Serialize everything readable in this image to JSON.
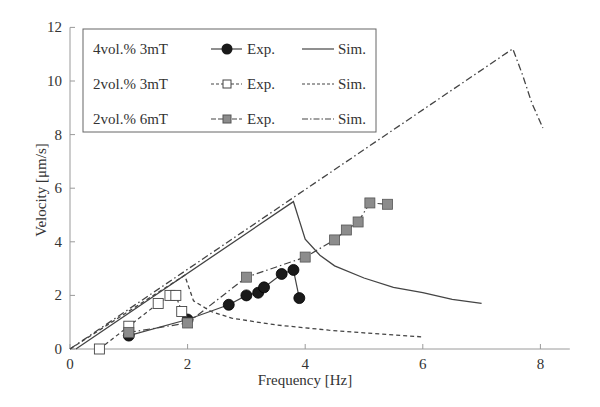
{
  "chart_data": {
    "type": "line",
    "title": "",
    "xlabel": "Frequency [Hz]",
    "ylabel": "Velocity [μm/s]",
    "xlim": [
      0,
      8.5
    ],
    "ylim": [
      0,
      12
    ],
    "x_ticks": [
      "0",
      "2",
      "4",
      "6",
      "8"
    ],
    "y_ticks": [
      "0",
      "2",
      "4",
      "6",
      "8",
      "10",
      "12"
    ],
    "grid": false,
    "legend_position": "upper-left",
    "legend": [
      {
        "group": "4vol.% 3mT",
        "exp_label": "Exp.",
        "sim_label": "Sim."
      },
      {
        "group": "2vol.% 3mT",
        "exp_label": "Exp.",
        "sim_label": "Sim."
      },
      {
        "group": "2vol.% 6mT",
        "exp_label": "Exp.",
        "sim_label": "Sim."
      }
    ],
    "series": [
      {
        "name": "4vol.% 3mT Exp.",
        "style": "solid-line filled-circle",
        "x": [
          1.0,
          2.0,
          2.7,
          3.0,
          3.2,
          3.3,
          3.6,
          3.8,
          3.9
        ],
        "y": [
          0.5,
          1.1,
          1.65,
          2.0,
          2.1,
          2.3,
          2.8,
          2.95,
          1.9
        ]
      },
      {
        "name": "4vol.% 3mT Sim.",
        "style": "solid",
        "x": [
          0.1,
          3.8,
          3.9,
          4.0,
          4.25,
          4.5,
          5.0,
          5.5,
          6.0,
          6.5,
          7.0
        ],
        "y": [
          0.0,
          5.5,
          4.8,
          4.1,
          3.5,
          3.1,
          2.65,
          2.3,
          2.1,
          1.85,
          1.7
        ]
      },
      {
        "name": "2vol.% 3mT Exp.",
        "style": "dashed-line open-square",
        "x": [
          0.5,
          1.0,
          1.5,
          1.7,
          1.8,
          1.9
        ],
        "y": [
          0.0,
          0.85,
          1.7,
          2.0,
          2.0,
          1.4
        ]
      },
      {
        "name": "2vol.% 3mT Sim.",
        "style": "dashed",
        "x": [
          0.0,
          1.95,
          2.1,
          2.4,
          2.75,
          3.5,
          4.4,
          5.0,
          6.0
        ],
        "y": [
          0.0,
          2.75,
          1.8,
          1.4,
          1.15,
          0.9,
          0.7,
          0.6,
          0.45
        ]
      },
      {
        "name": "2vol.% 6mT Exp.",
        "style": "dashdot-line gray-square",
        "x": [
          1.0,
          2.0,
          3.0,
          4.0,
          4.5,
          4.7,
          4.9,
          5.1,
          5.4
        ],
        "y": [
          0.62,
          0.97,
          2.68,
          3.43,
          4.07,
          4.44,
          4.74,
          5.45,
          5.4
        ]
      },
      {
        "name": "2vol.% 6mT Sim.",
        "style": "dashdot",
        "x": [
          0.0,
          7.53,
          7.7,
          7.85,
          8.04
        ],
        "y": [
          0.0,
          11.2,
          10.2,
          9.2,
          8.25
        ]
      }
    ]
  },
  "colors": {
    "axis": "#9a9a9a",
    "line": "#444444",
    "filled_marker": "#1a1a1a",
    "gray_marker": "#8c8c8c",
    "open_marker": "#ffffff"
  }
}
